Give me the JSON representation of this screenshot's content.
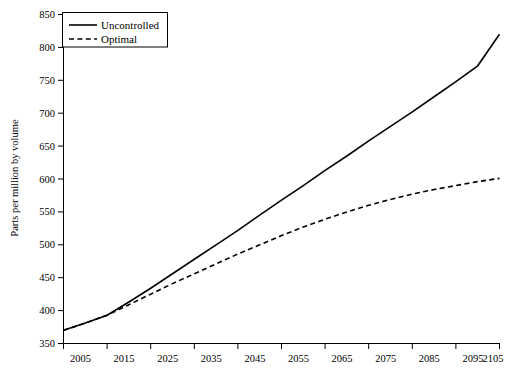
{
  "chart_data": {
    "type": "line",
    "title": "",
    "xlabel": "",
    "ylabel": "Parts per million by volume",
    "xlim": [
      2005,
      2105
    ],
    "ylim": [
      350,
      850
    ],
    "grid": false,
    "legend_position": "top-left",
    "xticks": [
      2005,
      2015,
      2025,
      2035,
      2045,
      2055,
      2065,
      2075,
      2085,
      2095,
      2105
    ],
    "yticks": [
      350,
      400,
      450,
      500,
      550,
      600,
      650,
      700,
      750,
      800,
      850
    ],
    "x": [
      2005,
      2010,
      2015,
      2020,
      2025,
      2030,
      2035,
      2040,
      2045,
      2050,
      2055,
      2060,
      2065,
      2070,
      2075,
      2080,
      2085,
      2090,
      2095,
      2100,
      2105
    ],
    "series": [
      {
        "name": "Uncontrolled",
        "style": "solid",
        "color": "#000000",
        "values": [
          370,
          381,
          393,
          413,
          434,
          456,
          478,
          500,
          522,
          545,
          568,
          590,
          613,
          635,
          658,
          680,
          702,
          725,
          748,
          772,
          820
        ]
      },
      {
        "name": "Optimal",
        "style": "dashed",
        "color": "#000000",
        "values": [
          370,
          381,
          393,
          409,
          425,
          441,
          456,
          471,
          486,
          500,
          514,
          527,
          539,
          550,
          560,
          569,
          577,
          584,
          590,
          596,
          601
        ]
      }
    ]
  },
  "yaxis": {
    "title": "Parts per million by volume",
    "labels": [
      "850",
      "800",
      "750",
      "700",
      "650",
      "600",
      "550",
      "500",
      "450",
      "400",
      "350"
    ]
  },
  "xaxis": {
    "labels": [
      "2005",
      "2015",
      "2025",
      "2035",
      "2045",
      "2055",
      "2065",
      "2075",
      "2085",
      "2095",
      "2105"
    ]
  },
  "legend": {
    "entries": [
      {
        "label": "Uncontrolled",
        "style": "solid"
      },
      {
        "label": "Optimal",
        "style": "dashed"
      }
    ]
  }
}
